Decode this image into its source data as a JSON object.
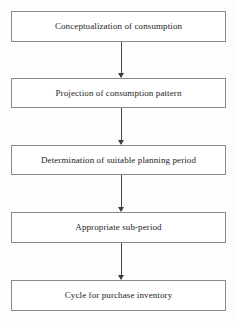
{
  "diagram": {
    "type": "flowchart",
    "orientation": "vertical",
    "title": "",
    "nodes": [
      {
        "id": "node-1",
        "label": "Conceptualization of consumption"
      },
      {
        "id": "node-2",
        "label": "Projection of consumption pattern"
      },
      {
        "id": "node-3",
        "label": "Determination of suitable planning period"
      },
      {
        "id": "node-4",
        "label": "Appropriate sub-period"
      },
      {
        "id": "node-5",
        "label": "Cycle for purchase inventory"
      }
    ],
    "edges": [
      {
        "from": "node-1",
        "to": "node-2",
        "style": "arrow-down"
      },
      {
        "from": "node-2",
        "to": "node-3",
        "style": "arrow-down"
      },
      {
        "from": "node-3",
        "to": "node-4",
        "style": "arrow-down"
      },
      {
        "from": "node-4",
        "to": "node-5",
        "style": "arrow-down"
      }
    ],
    "colors": {
      "page_background": "#fdfdfc",
      "node_fill": "#ffffff",
      "node_border": "#8a8a8a",
      "connector": "#4a4a4a",
      "arrowhead": "#3c3c3c",
      "text": "#1c1c1c"
    }
  }
}
